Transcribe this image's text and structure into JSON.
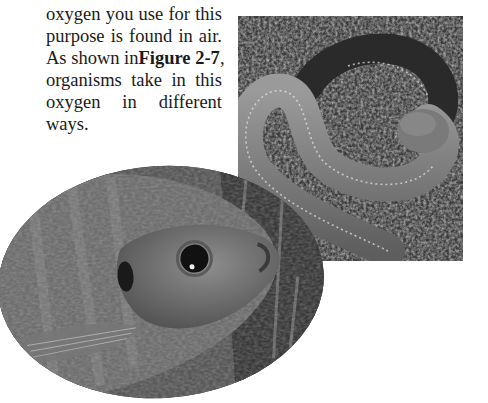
{
  "paragraph": {
    "lines": [
      "oxygen you use for this",
      "purpose is found in air.",
      "As shown in",
      "organisms take in this",
      "oxygen in different",
      "ways."
    ],
    "figure_ref": "Figure 2-7",
    "figure_ref_suffix": ","
  },
  "figures": {
    "worm_photo": {
      "subject": "earthworm on soil",
      "tone": "grayscale"
    },
    "fish_photo": {
      "subject": "bluegill fish head",
      "tone": "grayscale"
    }
  },
  "colors": {
    "text": "#1a1a1a",
    "background": "#ffffff"
  }
}
